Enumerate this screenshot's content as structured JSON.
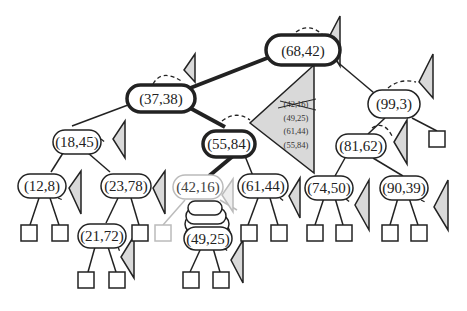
{
  "diagram": {
    "type": "binary-search-tree-with-subtree-triangles",
    "colors": {
      "edge": "#222222",
      "highlight_edge": "#222222",
      "faded": "#bbbbbb",
      "triangle_fill": "#d9d9d9",
      "background": "#ffffff"
    },
    "nodes": [
      {
        "id": "n68_42",
        "label": "(68,42)",
        "highlight": true
      },
      {
        "id": "n37_38",
        "label": "(37,38)",
        "highlight": true
      },
      {
        "id": "n99_3",
        "label": "(99,3)",
        "highlight": false
      },
      {
        "id": "n18_45",
        "label": "(18,45)",
        "highlight": false
      },
      {
        "id": "n55_84",
        "label": "(55,84)",
        "highlight": true
      },
      {
        "id": "n81_62",
        "label": "(81,62)",
        "highlight": false
      },
      {
        "id": "n12_8",
        "label": "(12,8)",
        "highlight": false
      },
      {
        "id": "n23_78",
        "label": "(23,78)",
        "highlight": false
      },
      {
        "id": "n42_16",
        "label": "(42,16)",
        "highlight": false,
        "faded": true
      },
      {
        "id": "n61_44",
        "label": "(61,44)",
        "highlight": false
      },
      {
        "id": "n74_50",
        "label": "(74,50)",
        "highlight": false
      },
      {
        "id": "n90_39",
        "label": "(90,39)",
        "highlight": false
      },
      {
        "id": "n21_72",
        "label": "(21,72)",
        "highlight": false
      },
      {
        "id": "n49_25",
        "label": "(49,25)",
        "highlight": false
      }
    ],
    "edges": [
      {
        "from": "(68,42)",
        "to": "(37,38)",
        "bold": true
      },
      {
        "from": "(68,42)",
        "to": "(99,3)",
        "bold": false
      },
      {
        "from": "(37,38)",
        "to": "(18,45)",
        "bold": false
      },
      {
        "from": "(37,38)",
        "to": "(55,84)",
        "bold": true
      },
      {
        "from": "(99,3)",
        "to": "(81,62)",
        "bold": false
      },
      {
        "from": "(18,45)",
        "to": "(12,8)",
        "bold": false
      },
      {
        "from": "(18,45)",
        "to": "(23,78)",
        "bold": false
      },
      {
        "from": "(55,84)",
        "to": "(42,16)",
        "bold": true
      },
      {
        "from": "(55,84)",
        "to": "(61,44)",
        "bold": false
      },
      {
        "from": "(81,62)",
        "to": "(74,50)",
        "bold": false
      },
      {
        "from": "(81,62)",
        "to": "(90,39)",
        "bold": false
      },
      {
        "from": "(23,78)",
        "to": "(21,72)",
        "bold": false
      },
      {
        "from": "(42,16)",
        "to": "(49,25)",
        "bold": false,
        "note": "stacked rotation ghosts"
      }
    ],
    "big_triangle": {
      "entries": [
        {
          "label": "(42,16)",
          "struck": true
        },
        {
          "label": "(49,25)",
          "struck": false
        },
        {
          "label": "(61,44)",
          "struck": false
        },
        {
          "label": "(55,84)",
          "struck": false
        }
      ]
    }
  }
}
